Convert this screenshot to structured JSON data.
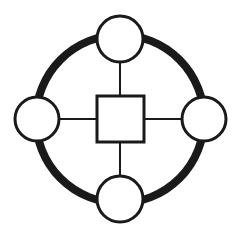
{
  "diagram": {
    "type": "node-link-diagram",
    "background_color": "#FFFFFF",
    "stroke_color": "#1A1A1A",
    "fill_color": "#FFFFFF",
    "canvas": {
      "width": 242,
      "height": 246
    },
    "ring": {
      "label": "outer-ring",
      "center_x": 120,
      "center_y": 119,
      "radius": 84,
      "stroke_width": 8,
      "color": "#1A1A1A"
    },
    "hub": {
      "label": "center-square",
      "shape": "square",
      "x": 97,
      "y": 96,
      "width": 47,
      "height": 46,
      "stroke_width": 3,
      "stroke_color": "#1A1A1A",
      "fill_color": "#FFFFFF"
    },
    "nodes": [
      {
        "id": "node-north",
        "label": "north-node",
        "shape": "circle",
        "cx": 120,
        "cy": 39,
        "r": 23,
        "stroke_width": 3,
        "stroke_color": "#1A1A1A",
        "fill_color": "#FFFFFF"
      },
      {
        "id": "node-east",
        "label": "east-node",
        "shape": "circle",
        "cx": 204,
        "cy": 119,
        "r": 22,
        "stroke_width": 3,
        "stroke_color": "#1A1A1A",
        "fill_color": "#FFFFFF"
      },
      {
        "id": "node-south",
        "label": "south-node",
        "shape": "circle",
        "cx": 120,
        "cy": 199,
        "r": 23,
        "stroke_width": 3,
        "stroke_color": "#1A1A1A",
        "fill_color": "#FFFFFF"
      },
      {
        "id": "node-west",
        "label": "west-node",
        "shape": "circle",
        "cx": 37,
        "cy": 119,
        "r": 22,
        "stroke_width": 3,
        "stroke_color": "#1A1A1A",
        "fill_color": "#FFFFFF"
      }
    ],
    "spokes": [
      {
        "id": "spoke-north",
        "label": "hub-to-north-link",
        "x1": 120,
        "y1": 62,
        "x2": 120,
        "y2": 96,
        "stroke_width": 2,
        "stroke_color": "#1A1A1A"
      },
      {
        "id": "spoke-east",
        "label": "hub-to-east-link",
        "x1": 144,
        "y1": 119,
        "x2": 182,
        "y2": 119,
        "stroke_width": 2,
        "stroke_color": "#1A1A1A"
      },
      {
        "id": "spoke-south",
        "label": "hub-to-south-link",
        "x1": 120,
        "y1": 142,
        "x2": 120,
        "y2": 176,
        "stroke_width": 2,
        "stroke_color": "#1A1A1A"
      },
      {
        "id": "spoke-west",
        "label": "hub-to-west-link",
        "x1": 59,
        "y1": 119,
        "x2": 97,
        "y2": 119,
        "stroke_width": 2,
        "stroke_color": "#1A1A1A"
      }
    ]
  }
}
